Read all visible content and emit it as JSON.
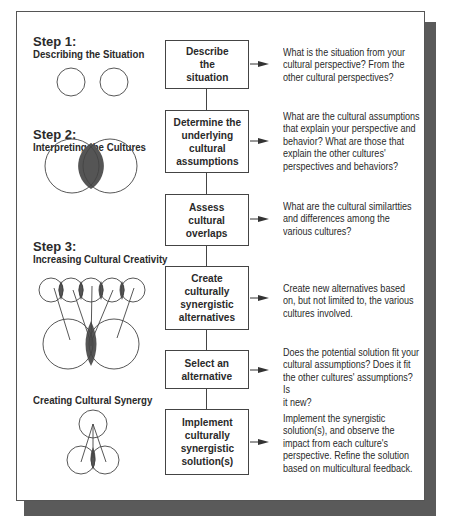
{
  "steps": [
    {
      "number": "Step 1:",
      "title": "Describing the Situation"
    },
    {
      "number": "Step 2:",
      "title": "Interpreting the Cultures"
    },
    {
      "number": "Step 3:",
      "title": "Increasing Cultural Creativity"
    },
    {
      "number": "",
      "title": "Creating Cultural Synergy"
    }
  ],
  "boxes": [
    {
      "label": "Describe\nthe\nsituation",
      "description": "What is the situation from your\ncultural perspective? From the\nother cultural perspectives?"
    },
    {
      "label": "Determine the\nunderlying\ncultural\nassumptions",
      "description": "What are the cultural assumptions\nthat explain your perspective and\nbehavior? What are those that\nexplain the other cultures'\nperspectives and behaviors?"
    },
    {
      "label": "Assess\ncultural\noverlaps",
      "description": "What are the cultural similartties\nand differences among the\nvarious cultures?"
    },
    {
      "label": "Create\nculturally\nsynergistic\nalternatives",
      "description": "Create new alternatives based\non, but not limited to, the various\ncultures involved."
    },
    {
      "label": "Select an\nalternative",
      "description": "Does the potential solution fit your\ncultural assumptions? Does it fit\nthe other cultures' assumptions? Is\nit new?"
    },
    {
      "label": "Implement\nculturally\nsynergistic\nsolution(s)",
      "description": "Implement the synergistic\nsolution(s), and observe the\nimpact from each culture's\nperspective.  Refine the solution\nbased on multicultural feedback."
    }
  ],
  "colors": {
    "overlap_fill": "#555555",
    "line": "#444444",
    "shadow": "#5a5a5a"
  }
}
